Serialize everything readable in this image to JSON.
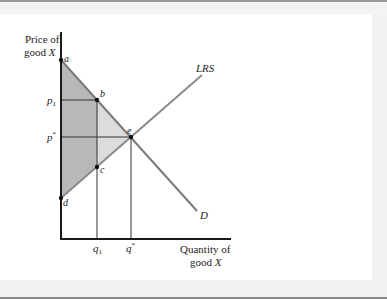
{
  "axes": {
    "y_label_line1": "Price of",
    "y_label_line2": "good",
    "y_label_var": "X",
    "x_label_line1": "Quantity of",
    "x_label_line2": "good",
    "x_label_var": "X"
  },
  "curves": {
    "supply_label": "LRS",
    "demand_label": "D"
  },
  "points": {
    "a": "a",
    "b": "b",
    "c": "c",
    "d": "d",
    "e": "e"
  },
  "price_ticks": {
    "p1": "p",
    "p1_sub": "1",
    "pstar": "p",
    "pstar_sup": "*"
  },
  "quantity_ticks": {
    "q1": "q",
    "q1_sub": "1",
    "qstar": "q",
    "qstar_sup": "*"
  },
  "colors": {
    "axis": "#1a1a1a",
    "curve": "#7a7a7a",
    "dark_shade": "#b8b8b8",
    "light_shade": "#dcdcdc",
    "guide": "#333333"
  }
}
